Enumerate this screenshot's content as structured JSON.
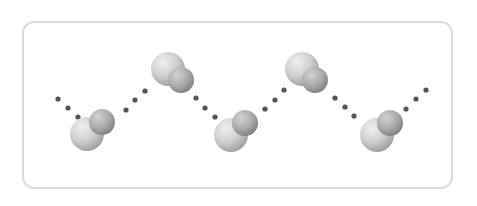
{
  "diagram": {
    "type": "hydrogen-bonded water chain",
    "colors": {
      "frame_border": "#dcdcdc",
      "bond_dot": "#555555",
      "large_atom_light": "#e4e4e4",
      "large_atom_dark": "#9c9c9c",
      "small_atom_light": "#c2c2c2",
      "small_atom_dark": "#7e7e7e"
    },
    "molecules": [
      {
        "large": {
          "cx": 87,
          "cy": 134,
          "r": 17
        },
        "small": {
          "cx": 102,
          "cy": 122,
          "r": 13
        }
      },
      {
        "large": {
          "cx": 168,
          "cy": 69,
          "r": 17
        },
        "small": {
          "cx": 181,
          "cy": 80,
          "r": 13
        }
      },
      {
        "large": {
          "cx": 231,
          "cy": 135,
          "r": 17
        },
        "small": {
          "cx": 245,
          "cy": 123,
          "r": 13
        }
      },
      {
        "large": {
          "cx": 302,
          "cy": 69,
          "r": 17
        },
        "small": {
          "cx": 315,
          "cy": 80,
          "r": 13
        }
      },
      {
        "large": {
          "cx": 377,
          "cy": 135,
          "r": 17
        },
        "small": {
          "cx": 390,
          "cy": 123,
          "r": 13
        }
      }
    ],
    "hydrogen_bonds": [
      [
        [
          58,
          99
        ],
        [
          68,
          108
        ],
        [
          78,
          117
        ]
      ],
      [
        [
          126,
          110
        ],
        [
          135,
          100
        ],
        [
          145,
          91
        ]
      ],
      [
        [
          196,
          98
        ],
        [
          205,
          108
        ],
        [
          215,
          117
        ]
      ],
      [
        [
          265,
          109
        ],
        [
          275,
          100
        ],
        [
          284,
          90
        ]
      ],
      [
        [
          335,
          98
        ],
        [
          345,
          107
        ],
        [
          354,
          116
        ]
      ],
      [
        [
          406,
          109
        ],
        [
          416,
          99
        ],
        [
          426,
          90
        ]
      ]
    ]
  }
}
